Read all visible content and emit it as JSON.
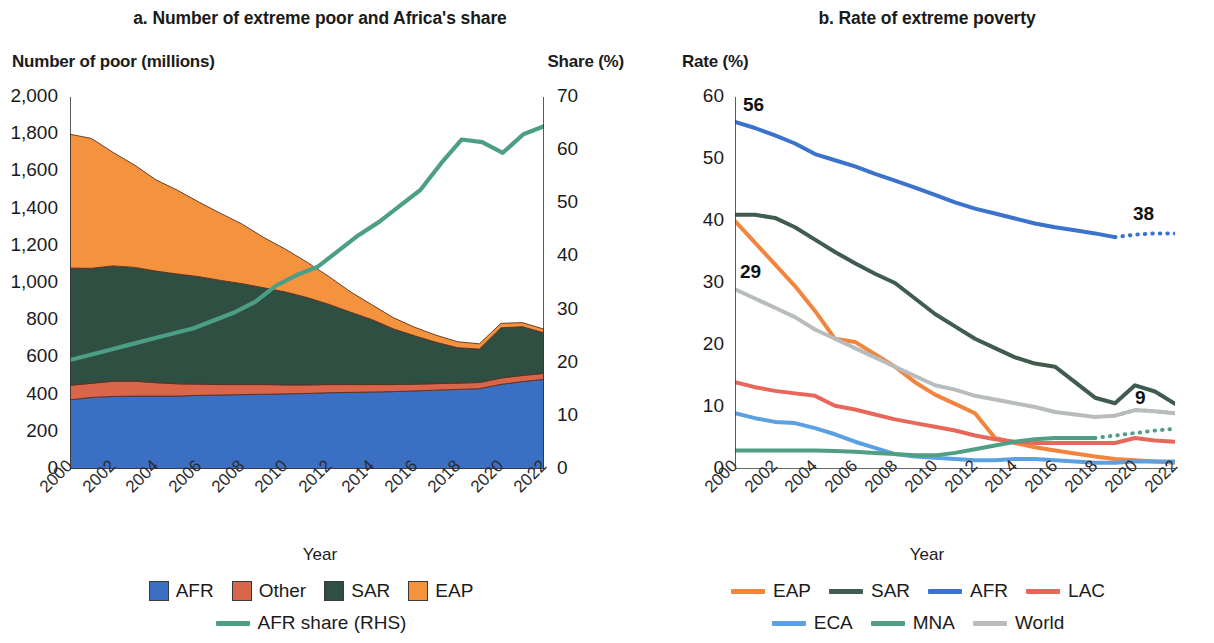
{
  "figure": {
    "x_axis_name": "Year"
  },
  "panel_a": {
    "title": "a. Number of extreme poor and Africa's share",
    "ylabel_left": "Number of poor (millions)",
    "ylabel_right": "Share (%)",
    "xlabel": "Year",
    "y_ticks_left": [
      "0",
      "200",
      "400",
      "600",
      "800",
      "1,000",
      "1,200",
      "1,400",
      "1,600",
      "1,800",
      "2,000"
    ],
    "y_ticks_right": [
      "0",
      "10",
      "20",
      "30",
      "40",
      "50",
      "60",
      "70"
    ],
    "x_ticks": [
      "2000",
      "2002",
      "2004",
      "2006",
      "2008",
      "2010",
      "2012",
      "2014",
      "2016",
      "2018",
      "2020",
      "2022"
    ],
    "legend": [
      {
        "label": "AFR",
        "color": "#3b6fc4",
        "type": "swatch"
      },
      {
        "label": "Other",
        "color": "#d9654b",
        "type": "swatch"
      },
      {
        "label": "SAR",
        "color": "#2f4f43",
        "type": "swatch"
      },
      {
        "label": "EAP",
        "color": "#f5923e",
        "type": "swatch"
      },
      {
        "label": "AFR share (RHS)",
        "color": "#4d9e87",
        "type": "line"
      }
    ]
  },
  "panel_b": {
    "title": "b. Rate of extreme poverty",
    "ylabel_left": "Rate (%)",
    "xlabel": "Year",
    "y_ticks": [
      "0",
      "10",
      "20",
      "30",
      "40",
      "50",
      "60"
    ],
    "x_ticks": [
      "2000",
      "2002",
      "2004",
      "2006",
      "2008",
      "2010",
      "2012",
      "2014",
      "2016",
      "2018",
      "2020",
      "2022"
    ],
    "annotations": [
      {
        "text": "56",
        "series": "AFR",
        "x": 2000,
        "y": 56
      },
      {
        "text": "29",
        "series": "World",
        "x": 2000,
        "y": 29
      },
      {
        "text": "38",
        "series": "AFR",
        "x": 2022,
        "y": 38
      },
      {
        "text": "9",
        "series": "World",
        "x": 2022,
        "y": 9
      }
    ],
    "legend": [
      {
        "label": "EAP",
        "color": "#f2843c",
        "type": "line"
      },
      {
        "label": "SAR",
        "color": "#3f5c4e",
        "type": "line"
      },
      {
        "label": "AFR",
        "color": "#3b72cc",
        "type": "line"
      },
      {
        "label": "LAC",
        "color": "#e8675a",
        "type": "line"
      },
      {
        "label": "ECA",
        "color": "#5ba0e0",
        "type": "line"
      },
      {
        "label": "MNA",
        "color": "#4e9f86",
        "type": "line"
      },
      {
        "label": "World",
        "color": "#b9bcbd",
        "type": "line"
      }
    ]
  },
  "chart_data": [
    {
      "type": "area",
      "panel": "a",
      "title": "a. Number of extreme poor and Africa's share",
      "xlabel": "Year",
      "ylabel": "Number of poor (millions)",
      "ylabel_secondary": "Share (%)",
      "ylim": [
        0,
        2000
      ],
      "ylim_secondary": [
        0,
        70
      ],
      "xlim": [
        2000,
        2022
      ],
      "stacked": true,
      "grid": false,
      "legend_position": "bottom",
      "x": [
        2000,
        2001,
        2002,
        2003,
        2004,
        2005,
        2006,
        2007,
        2008,
        2009,
        2010,
        2011,
        2012,
        2013,
        2014,
        2015,
        2016,
        2017,
        2018,
        2019,
        2020,
        2021,
        2022
      ],
      "series": [
        {
          "name": "AFR",
          "color": "#3b6fc4",
          "order": 1,
          "values": [
            372,
            385,
            390,
            392,
            392,
            392,
            396,
            398,
            400,
            402,
            404,
            406,
            410,
            412,
            414,
            416,
            420,
            424,
            428,
            432,
            455,
            470,
            482
          ]
        },
        {
          "name": "Other",
          "color": "#d9654b",
          "order": 2,
          "values": [
            78,
            76,
            82,
            80,
            72,
            66,
            60,
            56,
            54,
            52,
            48,
            46,
            44,
            42,
            40,
            38,
            36,
            35,
            34,
            33,
            34,
            33,
            32
          ]
        },
        {
          "name": "SAR",
          "color": "#2f4f43",
          "order": 3,
          "values": [
            630,
            618,
            620,
            612,
            600,
            590,
            578,
            560,
            542,
            520,
            500,
            470,
            432,
            390,
            350,
            300,
            260,
            222,
            190,
            180,
            270,
            262,
            218
          ]
        },
        {
          "name": "EAP",
          "color": "#f5923e",
          "order": 4,
          "values": [
            720,
            698,
            610,
            550,
            490,
            450,
            400,
            360,
            320,
            270,
            230,
            190,
            150,
            110,
            80,
            60,
            46,
            38,
            32,
            28,
            24,
            22,
            20
          ]
        }
      ],
      "secondary_series": [
        {
          "name": "AFR share (RHS)",
          "color": "#4d9e87",
          "axis": "right",
          "unit": "%",
          "values": [
            20.5,
            21.5,
            22.5,
            23.5,
            24.5,
            25.5,
            26.5,
            28.0,
            29.5,
            31.5,
            34.5,
            36.5,
            38.0,
            41.0,
            44.0,
            46.5,
            49.5,
            52.5,
            57.5,
            62.0,
            61.5,
            59.5,
            63.0,
            64.5
          ]
        }
      ]
    },
    {
      "type": "line",
      "panel": "b",
      "title": "b. Rate of extreme poverty",
      "xlabel": "Year",
      "ylabel": "Rate (%)",
      "ylim": [
        0,
        60
      ],
      "xlim": [
        2000,
        2022
      ],
      "grid": false,
      "legend_position": "bottom",
      "x": [
        2000,
        2001,
        2002,
        2003,
        2004,
        2005,
        2006,
        2007,
        2008,
        2009,
        2010,
        2011,
        2012,
        2013,
        2014,
        2015,
        2016,
        2017,
        2018,
        2019,
        2020,
        2021,
        2022
      ],
      "series": [
        {
          "name": "AFR",
          "color": "#3b72cc",
          "values": [
            56.0,
            55.0,
            53.8,
            52.5,
            50.8,
            49.8,
            48.8,
            47.6,
            46.5,
            45.4,
            44.2,
            43.0,
            42.0,
            41.2,
            40.4,
            39.6,
            39.0,
            38.5,
            38.0,
            37.4,
            null,
            null,
            null
          ],
          "projected": {
            "x": [
              2019,
              2020,
              2021,
              2022
            ],
            "values": [
              37.4,
              37.8,
              38.0,
              38.0
            ]
          }
        },
        {
          "name": "SAR",
          "color": "#3f5c4e",
          "values": [
            41.0,
            41.0,
            40.5,
            39.0,
            37.0,
            35.0,
            33.2,
            31.5,
            30.0,
            27.5,
            25.0,
            23.0,
            21.0,
            19.5,
            18.0,
            17.0,
            16.5,
            14.0,
            11.5,
            10.6,
            13.5,
            12.5,
            10.5
          ]
        },
        {
          "name": "EAP",
          "color": "#f2843c",
          "values": [
            40.0,
            36.5,
            33.0,
            29.5,
            25.5,
            21.0,
            20.5,
            18.5,
            16.5,
            14.0,
            12.0,
            10.5,
            9.0,
            5.0,
            4.2,
            3.5,
            3.0,
            2.5,
            2.0,
            1.6,
            1.4,
            1.2,
            1.0
          ]
        },
        {
          "name": "World",
          "color": "#b9bcbd",
          "values": [
            29.0,
            27.5,
            26.0,
            24.5,
            22.5,
            21.0,
            19.5,
            18.0,
            16.5,
            15.0,
            13.5,
            12.8,
            11.8,
            11.2,
            10.6,
            10.0,
            9.2,
            8.8,
            8.4,
            8.6,
            9.5,
            9.3,
            9.0
          ],
          "projected": {
            "x": [
              2019,
              2020,
              2021,
              2022
            ],
            "values": [
              8.6,
              9.5,
              9.3,
              9.0
            ]
          }
        },
        {
          "name": "LAC",
          "color": "#e8675a",
          "values": [
            14.0,
            13.2,
            12.6,
            12.2,
            11.8,
            10.2,
            9.6,
            8.8,
            8.0,
            7.4,
            6.8,
            6.2,
            5.4,
            4.8,
            4.4,
            4.2,
            4.2,
            4.2,
            4.2,
            4.2,
            5.0,
            4.6,
            4.4
          ]
        },
        {
          "name": "ECA",
          "color": "#5ba0e0",
          "values": [
            9.0,
            8.2,
            7.6,
            7.4,
            6.6,
            5.6,
            4.4,
            3.4,
            2.4,
            2.0,
            1.8,
            1.6,
            1.4,
            1.4,
            1.6,
            1.6,
            1.4,
            1.2,
            1.0,
            1.0,
            1.2,
            1.2,
            1.2
          ]
        },
        {
          "name": "MNA",
          "color": "#4e9f86",
          "values": [
            3.0,
            3.0,
            3.0,
            3.0,
            3.0,
            2.9,
            2.8,
            2.6,
            2.4,
            2.2,
            2.2,
            2.6,
            3.2,
            3.8,
            4.4,
            4.8,
            5.0,
            5.0,
            5.0,
            null,
            null,
            null
          ],
          "projected": {
            "x": [
              2018,
              2019,
              2020,
              2021,
              2022
            ],
            "values": [
              5.0,
              5.4,
              5.8,
              6.2,
              6.5
            ]
          }
        }
      ]
    }
  ]
}
